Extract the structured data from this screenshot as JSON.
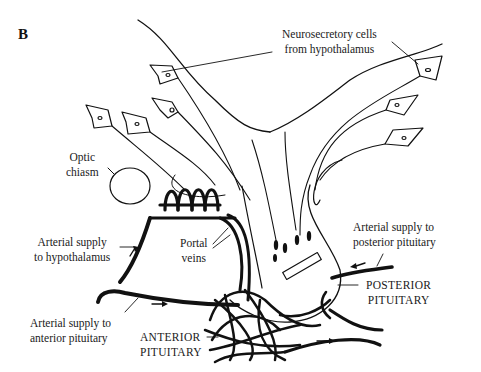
{
  "figure": {
    "panel_label": "B"
  },
  "labels": {
    "neurosecretory_line1": "Neurosecretory cells",
    "neurosecretory_line2": "from hypothalamus",
    "optic_line1": "Optic",
    "optic_line2": "chiasm",
    "arterial_hypo_line1": "Arterial supply",
    "arterial_hypo_line2": "to hypothalamus",
    "portal_line1": "Portal",
    "portal_line2": "veins",
    "arterial_ant_line1": "Arterial supply to",
    "arterial_ant_line2": "anterior pituitary",
    "anterior_line1": "ANTERIOR",
    "anterior_line2": "PITUITARY",
    "arterial_post_line1": "Arterial supply to",
    "arterial_post_line2": "posterior pituitary",
    "posterior_line1": "POSTERIOR",
    "posterior_line2": "PITUITARY"
  },
  "colors": {
    "ink": "#111111",
    "background": "#ffffff"
  }
}
